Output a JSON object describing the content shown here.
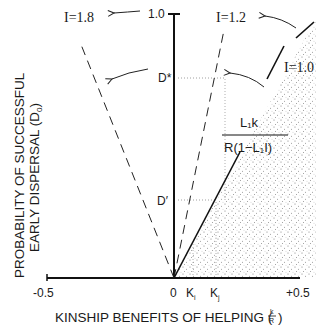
{
  "diagram": {
    "y_axis": {
      "label_line1": "PROBABILITY OF SUCCESSFUL",
      "label_line2": "EARLY DISPERSAL (D",
      "label_sub": "0",
      "label_close": ")",
      "top_tick": "1.0"
    },
    "x_axis": {
      "label": "KINSHIP BENEFITS OF HELPING (",
      "frac_num": "k",
      "frac_den": "R",
      "label_close": ")",
      "left_tick": "-0.5",
      "right_tick": "+0.5",
      "origin_tick": "0"
    },
    "lines": [
      {
        "name": "I=1.8",
        "label": "I=1.8",
        "style": "dashed"
      },
      {
        "name": "I=1.2",
        "label": "I=1.2",
        "style": "dashed"
      },
      {
        "name": "I=1.0",
        "label": "I=1.0",
        "style": "solid"
      }
    ],
    "markers": {
      "d_star": "D*",
      "d_prime": "D′",
      "k_i": "K",
      "k_i_sub": "i",
      "k_j": "K",
      "k_j_sub": "j"
    },
    "formula": {
      "numerator": "L₁k",
      "denominator": "R(1−L₁I)"
    },
    "shading": "region right of I=1.0 line (stippled)"
  }
}
